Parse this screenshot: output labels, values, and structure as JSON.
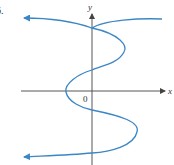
{
  "figure": {
    "problem_number": "6.",
    "axis_x_label": "x",
    "axis_y_label": "y",
    "origin_label": "0",
    "colors": {
      "curve": "#3b86c6",
      "axes": "#444444",
      "background": "#ffffff"
    }
  }
}
